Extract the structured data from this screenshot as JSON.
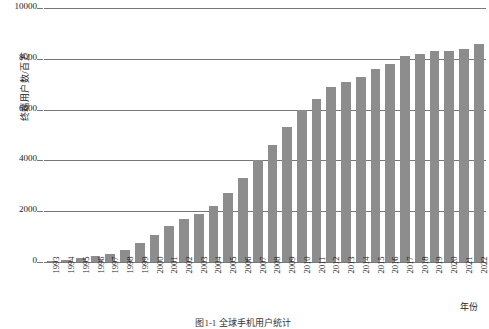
{
  "chart_data": {
    "type": "bar",
    "title": "",
    "xlabel": "年份",
    "ylabel": "终端用户数/百万",
    "ylim": [
      0,
      10000
    ],
    "yticks": [
      0,
      2000,
      4000,
      6000,
      8000,
      10000
    ],
    "grid": true,
    "legend": "none",
    "bar_color": "#8d8d8d",
    "categories": [
      "1993",
      "1994",
      "1995",
      "1996",
      "1997",
      "1998",
      "1999",
      "2000",
      "2001",
      "2002",
      "2003",
      "2004",
      "2005",
      "2006",
      "2007",
      "2008",
      "2009",
      "2010",
      "2011",
      "2012",
      "2013",
      "2014",
      "2015",
      "2016",
      "2017",
      "2018",
      "2019",
      "2020",
      "2021",
      "2022"
    ],
    "values": [
      40,
      80,
      140,
      220,
      330,
      490,
      730,
      1050,
      1400,
      1700,
      1900,
      2200,
      2700,
      3300,
      4000,
      4600,
      5300,
      6000,
      6400,
      6900,
      7100,
      7300,
      7600,
      7800,
      8100,
      8200,
      8300,
      8300,
      8400,
      8600
    ]
  },
  "axis": {
    "y_title": "终端用户数/百万",
    "x_title": "年份",
    "tick_labels_y": [
      "10000",
      "8000",
      "6000",
      "4000",
      "2000",
      "0"
    ]
  },
  "caption": {
    "text": "图1-1  全球手机用户统计"
  }
}
